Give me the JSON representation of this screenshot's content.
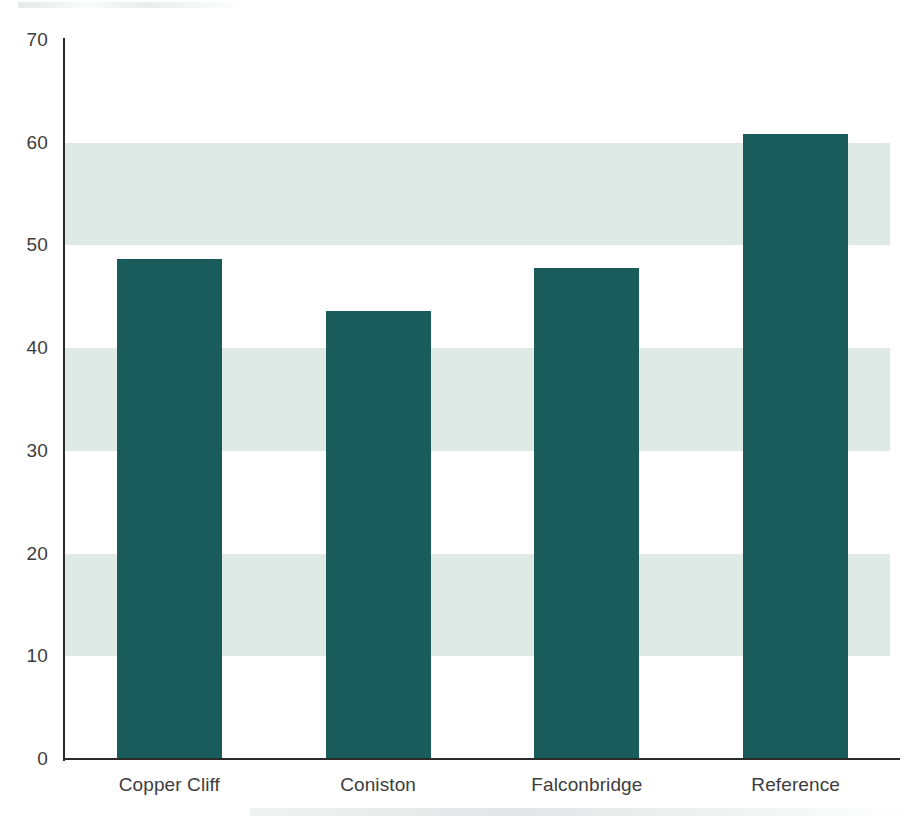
{
  "chart_data": {
    "type": "bar",
    "title": "",
    "subtitle": "",
    "xlabel": "",
    "ylabel": "",
    "categories": [
      "Copper Cliff",
      "Coniston",
      "Falconbridge",
      "Reference"
    ],
    "values": [
      48.7,
      43.6,
      47.8,
      60.8
    ],
    "series": [
      {
        "name": "",
        "values": [
          48.7,
          43.6,
          47.8,
          60.8
        ]
      }
    ],
    "ylim": [
      0,
      70
    ],
    "yticks": [
      0,
      10,
      20,
      30,
      40,
      50,
      60,
      70
    ],
    "ytick_labels": [
      "0",
      "10",
      "20",
      "30",
      "40",
      "50",
      "60",
      "70"
    ],
    "xtick_labels": [
      "Copper Cliff",
      "Coniston",
      "Falconbridge",
      "Reference"
    ],
    "grid": false,
    "banding": {
      "enabled": true,
      "orientation": "horizontal",
      "ranges": [
        [
          10,
          20
        ],
        [
          30,
          40
        ],
        [
          50,
          60
        ]
      ],
      "color": "#dfeae6"
    },
    "legend": {
      "visible": false,
      "position": "none",
      "entries": []
    },
    "colors": {
      "bar": "#1a5b5b",
      "band": "#dfeae6",
      "axis": "#2b2b2b",
      "tick_text": "#3d3d3d",
      "background": "#ffffff"
    },
    "annotations": []
  }
}
